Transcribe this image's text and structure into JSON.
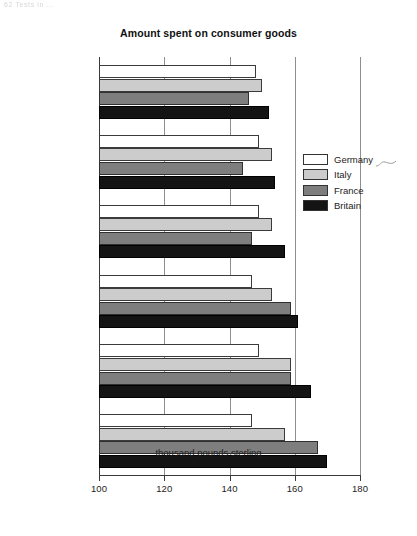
{
  "scan_artifact_text": "62 Tests in ...",
  "chart_data": {
    "type": "bar",
    "orientation": "horizontal",
    "title": "Amount spent on consumer goods",
    "xlabel": "thousand pounds sterling",
    "ylabel": "",
    "xlim": [
      100,
      180
    ],
    "xticks": [
      100,
      120,
      140,
      160,
      180
    ],
    "grid": true,
    "legend_position": "right",
    "categories": [
      "Personal stereos",
      "Tennis racquets",
      "Perfumes",
      "CDs",
      "Toys",
      "Photographic film"
    ],
    "series": [
      {
        "name": "Germany",
        "color": "#ffffff",
        "values": [
          148,
          149,
          149,
          147,
          149,
          147
        ]
      },
      {
        "name": "Italy",
        "color": "#cccccc",
        "values": [
          150,
          153,
          153,
          153,
          159,
          157
        ]
      },
      {
        "name": "France",
        "color": "#7e7e7e",
        "values": [
          146,
          144,
          147,
          159,
          159,
          167
        ]
      },
      {
        "name": "Britain",
        "color": "#141414",
        "values": [
          152,
          154,
          157,
          161,
          165,
          170
        ]
      }
    ]
  }
}
